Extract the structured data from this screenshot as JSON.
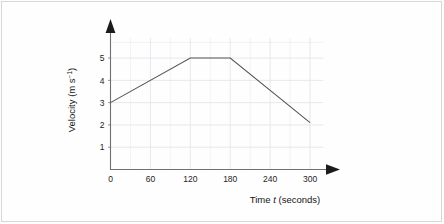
{
  "chart_data": {
    "type": "line",
    "title": "",
    "xlabel": "Time t  (seconds)",
    "xlabel_prefix": "Time ",
    "xlabel_variable": "t",
    "xlabel_suffix": "  (seconds)",
    "ylabel": "Velocity (m s⁻¹)",
    "ylabel_main": "Velocity (m s",
    "ylabel_exponent": "−1",
    "ylabel_close": ")",
    "xlim": [
      0,
      330
    ],
    "ylim": [
      0,
      5.9
    ],
    "x_ticks": [
      0,
      60,
      120,
      180,
      240,
      300
    ],
    "x_tick_labels": [
      "0",
      "60",
      "120",
      "180",
      "240",
      "300"
    ],
    "x_minor_step": 30,
    "y_ticks": [
      1,
      2,
      3,
      4,
      5
    ],
    "y_tick_labels": [
      "1",
      "2",
      "3",
      "4",
      "5"
    ],
    "grid": true,
    "legend": "none",
    "series": [
      {
        "name": "velocity",
        "color": "#555555",
        "x": [
          0,
          120,
          180,
          300
        ],
        "y": [
          3,
          5,
          5,
          2.1
        ]
      }
    ],
    "annotations": [
      {
        "label": "constant acceleration 0 to 120 s, velocity rises 3 to 5 m/s"
      },
      {
        "label": "constant velocity 120 to 180 s at 5 m/s"
      },
      {
        "label": "deceleration 180 to 300 s, velocity falls 5 to 2.1 m/s"
      }
    ]
  },
  "colors": {
    "background": "#fefefe",
    "border": "#d8d8d8",
    "axis": "#6f6f6f",
    "grid_major": "#e3e3ea",
    "grid_minor": "#eeeef2",
    "line": "#555555",
    "text": "#141414"
  }
}
